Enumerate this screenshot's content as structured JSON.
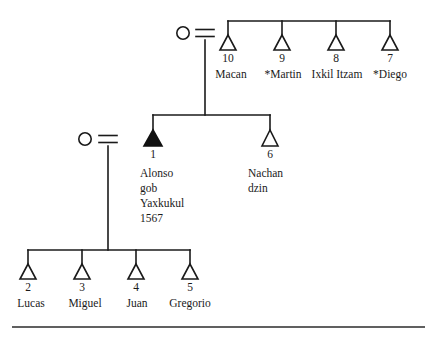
{
  "figure": {
    "type": "kinship-genealogy-chart",
    "title": "",
    "symbols": {
      "circle": "female",
      "triangle_open": "male",
      "triangle_filled": "male-focal-ego",
      "equals": "marriage-union",
      "vertical_line": "descent-line",
      "horizontal_bar": "sibling-bar"
    },
    "colors": {
      "ink": "#1a1a1a",
      "background": "#ffffff",
      "rule": "#2b2b2b"
    }
  },
  "generations": [
    {
      "id": "generation-1",
      "spouse": {
        "id": "g1-wife",
        "symbol": "circle",
        "sex": "female",
        "label": ""
      },
      "union_symbol": "=",
      "children": [
        {
          "id": "p10",
          "number": "10",
          "name": "Macan",
          "symbol": "triangle-open",
          "sex": "male",
          "starred": false
        },
        {
          "id": "p9",
          "number": "9",
          "name": "*Martin",
          "symbol": "triangle-open",
          "sex": "male",
          "starred": true
        },
        {
          "id": "p8",
          "number": "8",
          "name": "Ixkil Itzam",
          "symbol": "triangle-open",
          "sex": "male",
          "starred": false
        },
        {
          "id": "p7",
          "number": "7",
          "name": "*Diego",
          "symbol": "triangle-open",
          "sex": "male",
          "starred": true
        }
      ]
    },
    {
      "id": "generation-2",
      "spouse": {
        "id": "g2-wife",
        "symbol": "circle",
        "sex": "female",
        "label": ""
      },
      "union_symbol": "=",
      "children": [
        {
          "id": "p1",
          "number": "1",
          "symbol": "triangle-filled",
          "sex": "male",
          "focal": true,
          "name_lines": [
            "Alonso",
            "gob",
            "Yaxkukul",
            "1567"
          ]
        },
        {
          "id": "p6",
          "number": "6",
          "symbol": "triangle-open",
          "sex": "male",
          "focal": false,
          "name_lines": [
            "Nachan",
            "dzin"
          ]
        }
      ]
    },
    {
      "id": "generation-3",
      "children": [
        {
          "id": "p2",
          "number": "2",
          "name": "Lucas",
          "symbol": "triangle-open",
          "sex": "male"
        },
        {
          "id": "p3",
          "number": "3",
          "name": "Miguel",
          "symbol": "triangle-open",
          "sex": "male"
        },
        {
          "id": "p4",
          "number": "4",
          "name": "Juan",
          "symbol": "triangle-open",
          "sex": "male"
        },
        {
          "id": "p5",
          "number": "5",
          "name": "Gregorio",
          "symbol": "triangle-open",
          "sex": "male"
        }
      ]
    }
  ],
  "footer_rule": {
    "visible": true
  }
}
